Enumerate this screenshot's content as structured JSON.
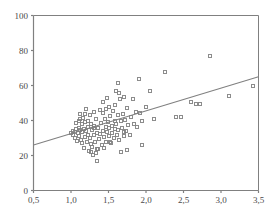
{
  "chart_data": {
    "type": "scatter",
    "title": "",
    "subtitle": "",
    "xlabel": "",
    "ylabel": "",
    "xlim": [
      0.5,
      3.5
    ],
    "ylim": [
      0,
      100
    ],
    "grid": false,
    "legend": null,
    "x_tick_labels": [
      "0,5",
      "1,0",
      "1,5",
      "2,0",
      "2,5",
      "3,0",
      "3,5"
    ],
    "x_tick_values": [
      0.5,
      1.0,
      1.5,
      2.0,
      2.5,
      3.0,
      3.5
    ],
    "y_tick_labels": [
      "0",
      "20",
      "40",
      "60",
      "80",
      "100"
    ],
    "y_tick_values": [
      0,
      20,
      40,
      60,
      80,
      100
    ],
    "marker": {
      "shape": "open-square",
      "size_px": 3,
      "edge_color": "#808080",
      "fill_color": "none"
    },
    "colors": {
      "axis": "#808080",
      "tick_label": "#4a4a4a",
      "marker": "#808080",
      "trend_line": "#808080",
      "background": "#ffffff"
    },
    "series": [
      {
        "name": "observations",
        "points": [
          [
            1.0,
            33.0
          ],
          [
            1.02,
            34.0
          ],
          [
            1.03,
            31.5
          ],
          [
            1.05,
            33.5
          ],
          [
            1.05,
            30.0
          ],
          [
            1.06,
            35.0
          ],
          [
            1.07,
            38.5
          ],
          [
            1.08,
            28.5
          ],
          [
            1.09,
            33.0
          ],
          [
            1.1,
            40.0
          ],
          [
            1.1,
            36.0
          ],
          [
            1.11,
            31.0
          ],
          [
            1.12,
            34.5
          ],
          [
            1.12,
            44.0
          ],
          [
            1.13,
            29.0
          ],
          [
            1.14,
            38.0
          ],
          [
            1.15,
            33.5
          ],
          [
            1.15,
            27.0
          ],
          [
            1.16,
            41.5
          ],
          [
            1.17,
            35.0
          ],
          [
            1.17,
            24.5
          ],
          [
            1.18,
            30.5
          ],
          [
            1.19,
            39.0
          ],
          [
            1.2,
            34.0
          ],
          [
            1.2,
            46.5
          ],
          [
            1.21,
            28.0
          ],
          [
            1.22,
            36.5
          ],
          [
            1.23,
            32.0
          ],
          [
            1.24,
            22.5
          ],
          [
            1.25,
            43.0
          ],
          [
            1.25,
            30.0
          ],
          [
            1.26,
            38.0
          ],
          [
            1.27,
            26.5
          ],
          [
            1.28,
            34.5
          ],
          [
            1.29,
            20.5
          ],
          [
            1.3,
            45.0
          ],
          [
            1.3,
            31.5
          ],
          [
            1.31,
            37.0
          ],
          [
            1.32,
            27.5
          ],
          [
            1.33,
            41.0
          ],
          [
            1.34,
            33.0
          ],
          [
            1.35,
            17.0
          ],
          [
            1.35,
            24.0
          ],
          [
            1.36,
            36.0
          ],
          [
            1.37,
            29.5
          ],
          [
            1.38,
            46.0
          ],
          [
            1.39,
            32.5
          ],
          [
            1.4,
            38.5
          ],
          [
            1.41,
            26.0
          ],
          [
            1.42,
            34.0
          ],
          [
            1.43,
            44.5
          ],
          [
            1.44,
            30.5
          ],
          [
            1.45,
            41.0
          ],
          [
            1.46,
            36.5
          ],
          [
            1.47,
            28.0
          ],
          [
            1.48,
            33.5
          ],
          [
            1.48,
            53.0
          ],
          [
            1.49,
            39.0
          ],
          [
            1.5,
            31.0
          ],
          [
            1.5,
            48.0
          ],
          [
            1.51,
            35.5
          ],
          [
            1.52,
            42.5
          ],
          [
            1.53,
            27.0
          ],
          [
            1.54,
            37.0
          ],
          [
            1.55,
            33.0
          ],
          [
            1.56,
            45.5
          ],
          [
            1.57,
            30.0
          ],
          [
            1.58,
            40.0
          ],
          [
            1.59,
            35.0
          ],
          [
            1.6,
            57.0
          ],
          [
            1.6,
            38.0
          ],
          [
            1.61,
            31.5
          ],
          [
            1.62,
            61.5
          ],
          [
            1.62,
            43.0
          ],
          [
            1.63,
            34.5
          ],
          [
            1.64,
            29.0
          ],
          [
            1.65,
            52.5
          ],
          [
            1.66,
            39.5
          ],
          [
            1.67,
            22.0
          ],
          [
            1.68,
            36.0
          ],
          [
            1.69,
            44.0
          ],
          [
            1.7,
            31.0
          ],
          [
            1.71,
            53.5
          ],
          [
            1.72,
            40.5
          ],
          [
            1.73,
            34.0
          ],
          [
            1.74,
            23.0
          ],
          [
            1.75,
            47.0
          ],
          [
            1.76,
            37.5
          ],
          [
            1.78,
            31.5
          ],
          [
            1.8,
            42.0
          ],
          [
            1.82,
            52.5
          ],
          [
            1.84,
            38.0
          ],
          [
            1.86,
            45.0
          ],
          [
            1.88,
            36.5
          ],
          [
            1.9,
            63.5
          ],
          [
            1.92,
            44.5
          ],
          [
            1.94,
            26.0
          ],
          [
            1.95,
            40.0
          ],
          [
            2.0,
            47.5
          ],
          [
            2.05,
            57.0
          ],
          [
            2.1,
            41.0
          ],
          [
            2.25,
            67.5
          ],
          [
            2.4,
            42.0
          ],
          [
            2.47,
            42.0
          ],
          [
            2.6,
            50.5
          ],
          [
            2.67,
            49.5
          ],
          [
            2.72,
            49.5
          ],
          [
            2.85,
            77.0
          ],
          [
            3.1,
            54.0
          ],
          [
            3.42,
            59.5
          ],
          [
            1.12,
            41.0
          ],
          [
            1.18,
            43.5
          ],
          [
            1.22,
            39.5
          ],
          [
            1.28,
            25.0
          ],
          [
            1.33,
            21.5
          ],
          [
            1.36,
            23.5
          ],
          [
            1.42,
            50.5
          ],
          [
            1.47,
            46.5
          ],
          [
            1.52,
            27.5
          ],
          [
            1.58,
            49.0
          ],
          [
            1.64,
            55.5
          ],
          [
            1.7,
            33.5
          ],
          [
            1.26,
            22.0
          ],
          [
            1.31,
            35.5
          ],
          [
            1.44,
            24.5
          ]
        ]
      }
    ],
    "trend_line": {
      "name": "linear fit",
      "x_start": 0.5,
      "y_start": 26.0,
      "x_end": 3.5,
      "y_end": 65.0,
      "slope": 13.0,
      "intercept": 19.5
    }
  }
}
